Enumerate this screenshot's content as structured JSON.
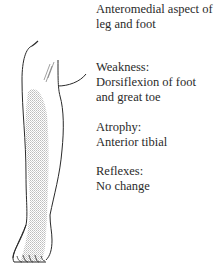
{
  "figure": {
    "caption_title": [
      "Anteromedial aspect of",
      "leg and foot"
    ],
    "weakness": {
      "label": "Weakness:",
      "lines": [
        "Dorsiflexion of foot",
        "and great toe"
      ]
    },
    "atrophy": {
      "label": "Atrophy:",
      "lines": [
        "Anterior tibial"
      ]
    },
    "reflexes": {
      "label": "Reflexes:",
      "lines": [
        "No change"
      ]
    },
    "illustration": "leg-and-foot-with-shaded-sensory-area",
    "colors": {
      "ink": "#2a2a2a",
      "shading": "#c8c8c8"
    }
  }
}
